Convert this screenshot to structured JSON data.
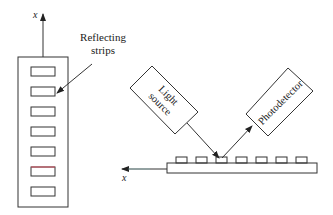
{
  "diagram": {
    "left_panel": {
      "axis_label": "x",
      "annotation_line1": "Reflecting",
      "annotation_line2": "strips",
      "strip_count": 7,
      "highlighted_strip_index": 5,
      "highlight_color": "#d04a5a"
    },
    "right_panel": {
      "light_source_line1": "Light",
      "light_source_line2": "source",
      "photodetector": "Photodetector",
      "axis_label": "x",
      "strip_count": 7
    },
    "colors": {
      "stroke": "#333333",
      "background": "#ffffff",
      "axis_tint": "#7fc9c9"
    }
  }
}
